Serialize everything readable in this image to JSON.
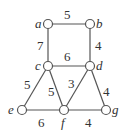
{
  "graph": {
    "nodes": [
      {
        "id": "a",
        "label": "a",
        "x": 48,
        "y": 24,
        "lx": 35,
        "ly": 28
      },
      {
        "id": "b",
        "label": "b",
        "x": 90,
        "y": 24,
        "lx": 96,
        "ly": 28
      },
      {
        "id": "c",
        "label": "c",
        "x": 48,
        "y": 66,
        "lx": 35,
        "ly": 70
      },
      {
        "id": "d",
        "label": "d",
        "x": 90,
        "y": 66,
        "lx": 96,
        "ly": 70
      },
      {
        "id": "e",
        "label": "e",
        "x": 22,
        "y": 110,
        "lx": 8,
        "ly": 114
      },
      {
        "id": "f",
        "label": "f",
        "x": 64,
        "y": 110,
        "lx": 61,
        "ly": 127
      },
      {
        "id": "g",
        "label": "g",
        "x": 106,
        "y": 110,
        "lx": 112,
        "ly": 114
      }
    ],
    "edges": [
      {
        "from": "a",
        "to": "b",
        "weight": "5",
        "lx": 64,
        "ly": 19
      },
      {
        "from": "a",
        "to": "c",
        "weight": "7",
        "lx": 37,
        "ly": 50
      },
      {
        "from": "b",
        "to": "d",
        "weight": "4",
        "lx": 95,
        "ly": 50
      },
      {
        "from": "c",
        "to": "d",
        "weight": "6",
        "lx": 64,
        "ly": 61
      },
      {
        "from": "c",
        "to": "e",
        "weight": "5",
        "lx": 24,
        "ly": 89
      },
      {
        "from": "c",
        "to": "f",
        "weight": "5",
        "lx": 48,
        "ly": 96
      },
      {
        "from": "d",
        "to": "f",
        "weight": "3",
        "lx": 68,
        "ly": 88
      },
      {
        "from": "d",
        "to": "g",
        "weight": "4",
        "lx": 103,
        "ly": 96
      },
      {
        "from": "e",
        "to": "f",
        "weight": "6",
        "lx": 38,
        "ly": 127
      },
      {
        "from": "f",
        "to": "g",
        "weight": "4",
        "lx": 85,
        "ly": 127
      }
    ]
  }
}
